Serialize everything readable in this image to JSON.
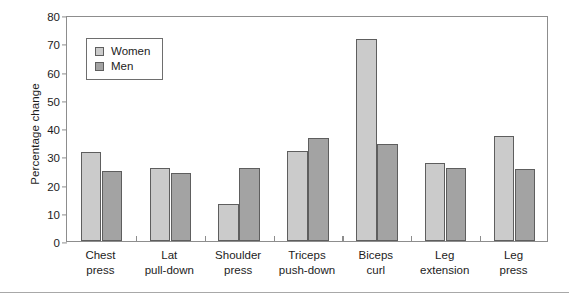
{
  "chart_data": {
    "type": "bar",
    "title": "",
    "xlabel": "",
    "ylabel": "Percentage change",
    "ylim": [
      0,
      80
    ],
    "ytick_step": 10,
    "yticks": [
      80,
      70,
      60,
      50,
      40,
      30,
      20,
      10,
      0
    ],
    "grid": false,
    "legend_position": "upper-left-inside",
    "categories": [
      "Chest press",
      "Lat pull-down",
      "Shoulder press",
      "Triceps push-down",
      "Biceps curl",
      "Leg extension",
      "Leg press"
    ],
    "category_lines": [
      [
        "Chest",
        "press"
      ],
      [
        "Lat",
        "pull-down"
      ],
      [
        "Shoulder",
        "press"
      ],
      [
        "Triceps",
        "push-down"
      ],
      [
        "Biceps",
        "curl"
      ],
      [
        "Leg",
        "extension"
      ],
      [
        "Leg",
        "press"
      ]
    ],
    "series": [
      {
        "name": "Women",
        "color": "#cbcbcb",
        "values": [
          31.5,
          25.8,
          13.2,
          32.0,
          71.5,
          27.5,
          37.0
        ]
      },
      {
        "name": "Men",
        "color": "#a3a3a3",
        "values": [
          24.8,
          24.0,
          25.8,
          36.5,
          34.5,
          26.0,
          25.5
        ]
      }
    ]
  },
  "legend": {
    "items": [
      {
        "label": "Women",
        "swatch": "women"
      },
      {
        "label": "Men",
        "swatch": "men"
      }
    ]
  },
  "axis": {
    "y_title": "Percentage change"
  },
  "colors": {
    "women_bar": "#cbcbcb",
    "men_bar": "#a3a3a3",
    "bar_outline": "#5e5e5e",
    "frame": "#8d8d8d",
    "text": "#1c1c1c",
    "rule": "#a8a8a8"
  }
}
